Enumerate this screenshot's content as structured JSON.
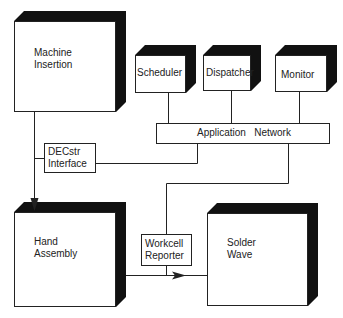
{
  "diagram": {
    "nodes": {
      "machine_insertion": {
        "line1": "Machine",
        "line2": "Insertion"
      },
      "scheduler": {
        "label": "Scheduler"
      },
      "dispatcher": {
        "label": "Dispatcher"
      },
      "monitor": {
        "label": "Monitor"
      },
      "application_network": {
        "label": "Application   Network"
      },
      "decstr_interface": {
        "line1": "DECstr",
        "line2": "Interface"
      },
      "hand_assembly": {
        "line1": "Hand",
        "line2": "Assembly"
      },
      "workcell_reporter": {
        "line1": "Workcell",
        "line2": "Reporter"
      },
      "solder_wave": {
        "line1": "Solder",
        "line2": "Wave"
      }
    },
    "edges": [
      {
        "from": "Machine Insertion",
        "to": "Hand Assembly",
        "arrow": true
      },
      {
        "from": "Scheduler",
        "to": "Application Network"
      },
      {
        "from": "Dispatcher",
        "to": "Application Network"
      },
      {
        "from": "Monitor",
        "to": "Application Network"
      },
      {
        "from": "Application Network",
        "to": "DECstr Interface"
      },
      {
        "from": "DECstr Interface",
        "to": "Machine Insertion line"
      },
      {
        "from": "Application Network",
        "to": "Workcell Reporter"
      },
      {
        "from": "Hand Assembly",
        "to": "Solder Wave",
        "arrow": true
      }
    ]
  }
}
